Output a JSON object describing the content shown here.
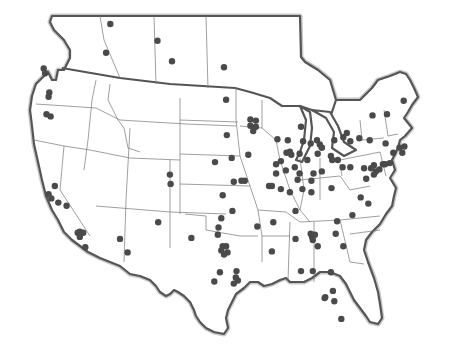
{
  "map": {
    "title": "",
    "region": "United States and southern Canada",
    "projection": "simple equirectangular approximation",
    "colors": {
      "dot": "#4a4a4a",
      "outline": "#555555",
      "border": "#777777",
      "background": "#ffffff"
    },
    "locations": [
      {
        "region": "British Columbia",
        "lon": -123.1,
        "lat": 49.8
      },
      {
        "region": "British Columbia",
        "lon": -122.9,
        "lat": 49.4
      },
      {
        "region": "Alberta",
        "lon": -114.1,
        "lat": 51.1
      },
      {
        "region": "Alberta",
        "lon": -113.5,
        "lat": 53.5
      },
      {
        "region": "Saskatchewan",
        "lon": -106.7,
        "lat": 52.1
      },
      {
        "region": "Saskatchewan",
        "lon": -104.6,
        "lat": 50.4
      },
      {
        "region": "Manitoba",
        "lon": -97.1,
        "lat": 49.9
      },
      {
        "region": "Washington",
        "lon": -122.3,
        "lat": 47.6
      },
      {
        "region": "Washington",
        "lon": -122.4,
        "lat": 47.2
      },
      {
        "region": "Oregon",
        "lon": -122.7,
        "lat": 45.5
      },
      {
        "region": "Oregon",
        "lon": -122.1,
        "lat": 45.3
      },
      {
        "region": "California",
        "lon": -122.4,
        "lat": 37.8
      },
      {
        "region": "California",
        "lon": -122.0,
        "lat": 37.4
      },
      {
        "region": "California",
        "lon": -121.5,
        "lat": 38.6
      },
      {
        "region": "California",
        "lon": -121.0,
        "lat": 37.0
      },
      {
        "region": "California",
        "lon": -119.8,
        "lat": 36.7
      },
      {
        "region": "California",
        "lon": -118.2,
        "lat": 34.1
      },
      {
        "region": "California",
        "lon": -117.9,
        "lat": 34.2
      },
      {
        "region": "California",
        "lon": -117.4,
        "lat": 34.1
      },
      {
        "region": "California",
        "lon": -117.9,
        "lat": 33.7
      },
      {
        "region": "California",
        "lon": -117.1,
        "lat": 32.7
      },
      {
        "region": "Arizona",
        "lon": -112.1,
        "lat": 33.5
      },
      {
        "region": "Arizona",
        "lon": -111.0,
        "lat": 32.2
      },
      {
        "region": "New Mexico",
        "lon": -106.6,
        "lat": 35.1
      },
      {
        "region": "Colorado",
        "lon": -104.9,
        "lat": 39.7
      },
      {
        "region": "Colorado",
        "lon": -104.8,
        "lat": 38.8
      },
      {
        "region": "Texas",
        "lon": -101.8,
        "lat": 33.6
      },
      {
        "region": "Texas",
        "lon": -97.3,
        "lat": 32.8
      },
      {
        "region": "Texas",
        "lon": -96.8,
        "lat": 32.8
      },
      {
        "region": "Texas",
        "lon": -97.5,
        "lat": 32.4
      },
      {
        "region": "Texas",
        "lon": -96.6,
        "lat": 32.2
      },
      {
        "region": "Texas",
        "lon": -97.1,
        "lat": 32.0
      },
      {
        "region": "Texas",
        "lon": -98.0,
        "lat": 33.9
      },
      {
        "region": "Texas",
        "lon": -97.7,
        "lat": 30.3
      },
      {
        "region": "Texas",
        "lon": -95.4,
        "lat": 29.8
      },
      {
        "region": "Texas",
        "lon": -95.1,
        "lat": 29.5
      },
      {
        "region": "Texas",
        "lon": -95.7,
        "lat": 29.2
      },
      {
        "region": "Texas",
        "lon": -95.3,
        "lat": 30.4
      },
      {
        "region": "Texas",
        "lon": -98.5,
        "lat": 29.4
      },
      {
        "region": "Oklahoma",
        "lon": -97.5,
        "lat": 35.5
      },
      {
        "region": "Oklahoma",
        "lon": -95.9,
        "lat": 36.2
      },
      {
        "region": "Oklahoma",
        "lon": -97.9,
        "lat": 34.6
      },
      {
        "region": "Kansas",
        "lon": -97.3,
        "lat": 37.7
      },
      {
        "region": "Kansas",
        "lon": -95.7,
        "lat": 39.0
      },
      {
        "region": "Nebraska",
        "lon": -96.0,
        "lat": 41.3
      },
      {
        "region": "Nebraska",
        "lon": -98.4,
        "lat": 40.9
      },
      {
        "region": "South Dakota",
        "lon": -96.7,
        "lat": 43.5
      },
      {
        "region": "North Dakota",
        "lon": -96.8,
        "lat": 46.9
      },
      {
        "region": "Minnesota",
        "lon": -93.3,
        "lat": 45.0
      },
      {
        "region": "Minnesota",
        "lon": -92.5,
        "lat": 44.9
      },
      {
        "region": "Minnesota",
        "lon": -93.3,
        "lat": 44.4
      },
      {
        "region": "Minnesota",
        "lon": -92.5,
        "lat": 44.3
      },
      {
        "region": "Minnesota",
        "lon": -92.9,
        "lat": 43.9
      },
      {
        "region": "Iowa",
        "lon": -93.6,
        "lat": 41.6
      },
      {
        "region": "Missouri",
        "lon": -94.6,
        "lat": 39.1
      },
      {
        "region": "Missouri",
        "lon": -94.1,
        "lat": 39.1
      },
      {
        "region": "Missouri",
        "lon": -90.2,
        "lat": 38.6
      },
      {
        "region": "Missouri",
        "lon": -90.6,
        "lat": 38.6
      },
      {
        "region": "Arkansas",
        "lon": -92.3,
        "lat": 34.7
      },
      {
        "region": "Mississippi",
        "lon": -90.2,
        "lat": 32.3
      },
      {
        "region": "Tennessee",
        "lon": -90.0,
        "lat": 35.1
      },
      {
        "region": "Tennessee",
        "lon": -86.8,
        "lat": 36.2
      },
      {
        "region": "Alabama",
        "lon": -86.8,
        "lat": 33.5
      },
      {
        "region": "Georgia",
        "lon": -84.4,
        "lat": 33.7
      },
      {
        "region": "Georgia",
        "lon": -84.6,
        "lat": 34.0
      },
      {
        "region": "Georgia",
        "lon": -84.0,
        "lat": 33.9
      },
      {
        "region": "Georgia",
        "lon": -84.3,
        "lat": 33.4
      },
      {
        "region": "Georgia",
        "lon": -83.6,
        "lat": 32.8
      },
      {
        "region": "South Carolina",
        "lon": -81.0,
        "lat": 34.0
      },
      {
        "region": "South Carolina",
        "lon": -79.9,
        "lat": 32.8
      },
      {
        "region": "North Carolina",
        "lon": -80.8,
        "lat": 35.2
      },
      {
        "region": "North Carolina",
        "lon": -78.6,
        "lat": 35.8
      },
      {
        "region": "Florida",
        "lon": -86.0,
        "lat": 30.4
      },
      {
        "region": "Florida",
        "lon": -84.3,
        "lat": 30.4
      },
      {
        "region": "Florida",
        "lon": -81.7,
        "lat": 30.3
      },
      {
        "region": "Florida",
        "lon": -81.4,
        "lat": 28.5
      },
      {
        "region": "Florida",
        "lon": -82.5,
        "lat": 27.9
      },
      {
        "region": "Florida",
        "lon": -82.6,
        "lat": 27.8
      },
      {
        "region": "Florida",
        "lon": -81.2,
        "lat": 27.5
      },
      {
        "region": "Florida",
        "lon": -80.2,
        "lat": 25.8
      },
      {
        "region": "Wisconsin",
        "lon": -89.4,
        "lat": 43.1
      },
      {
        "region": "Wisconsin",
        "lon": -87.9,
        "lat": 43.0
      },
      {
        "region": "Illinois",
        "lon": -87.6,
        "lat": 41.9
      },
      {
        "region": "Illinois",
        "lon": -88.1,
        "lat": 41.8
      },
      {
        "region": "Illinois",
        "lon": -89.6,
        "lat": 40.7
      },
      {
        "region": "Illinois",
        "lon": -88.2,
        "lat": 40.1
      },
      {
        "region": "Illinois",
        "lon": -89.6,
        "lat": 39.8
      },
      {
        "region": "Illinois",
        "lon": -88.9,
        "lat": 41.0
      },
      {
        "region": "Illinois",
        "lon": -88.9,
        "lat": 38.3
      },
      {
        "region": "Indiana",
        "lon": -87.4,
        "lat": 41.6
      },
      {
        "region": "Indiana",
        "lon": -86.2,
        "lat": 41.7
      },
      {
        "region": "Indiana",
        "lon": -85.1,
        "lat": 41.1
      },
      {
        "region": "Indiana",
        "lon": -86.2,
        "lat": 39.8
      },
      {
        "region": "Indiana",
        "lon": -86.5,
        "lat": 39.2
      },
      {
        "region": "Indiana",
        "lon": -87.6,
        "lat": 38.0
      },
      {
        "region": "Indiana",
        "lon": -86.9,
        "lat": 40.4
      },
      {
        "region": "Michigan",
        "lon": -85.7,
        "lat": 42.9
      },
      {
        "region": "Michigan",
        "lon": -84.6,
        "lat": 42.7
      },
      {
        "region": "Michigan",
        "lon": -83.0,
        "lat": 42.3
      },
      {
        "region": "Michigan",
        "lon": -83.3,
        "lat": 42.6
      },
      {
        "region": "Michigan",
        "lon": -83.7,
        "lat": 43.0
      },
      {
        "region": "Michigan",
        "lon": -86.0,
        "lat": 44.3
      },
      {
        "region": "Ohio",
        "lon": -84.2,
        "lat": 39.8
      },
      {
        "region": "Ohio",
        "lon": -84.5,
        "lat": 39.1
      },
      {
        "region": "Ohio",
        "lon": -83.0,
        "lat": 40.0
      },
      {
        "region": "Ohio",
        "lon": -81.7,
        "lat": 41.5
      },
      {
        "region": "Ohio",
        "lon": -81.5,
        "lat": 41.1
      },
      {
        "region": "Ohio",
        "lon": -83.6,
        "lat": 41.7
      },
      {
        "region": "Ohio",
        "lon": -80.7,
        "lat": 41.1
      },
      {
        "region": "Kentucky",
        "lon": -85.8,
        "lat": 38.3
      },
      {
        "region": "Kentucky",
        "lon": -84.5,
        "lat": 38.0
      },
      {
        "region": "West Virginia",
        "lon": -81.6,
        "lat": 38.4
      },
      {
        "region": "Pennsylvania",
        "lon": -80.0,
        "lat": 40.4
      },
      {
        "region": "Pennsylvania",
        "lon": -76.9,
        "lat": 40.3
      },
      {
        "region": "Pennsylvania",
        "lon": -75.9,
        "lat": 40.3
      },
      {
        "region": "Pennsylvania",
        "lon": -75.2,
        "lat": 40.0
      },
      {
        "region": "Pennsylvania",
        "lon": -75.5,
        "lat": 40.6
      },
      {
        "region": "Pennsylvania",
        "lon": -78.9,
        "lat": 40.4
      },
      {
        "region": "New Jersey",
        "lon": -74.2,
        "lat": 40.7
      },
      {
        "region": "New Jersey",
        "lon": -74.7,
        "lat": 40.2
      },
      {
        "region": "Maryland",
        "lon": -76.6,
        "lat": 39.3
      },
      {
        "region": "Delaware",
        "lon": -75.5,
        "lat": 39.7
      },
      {
        "region": "Virginia",
        "lon": -77.4,
        "lat": 37.5
      },
      {
        "region": "Virginia",
        "lon": -76.3,
        "lat": 36.9
      },
      {
        "region": "New York",
        "lon": -78.9,
        "lat": 42.9
      },
      {
        "region": "New York",
        "lon": -77.6,
        "lat": 43.2
      },
      {
        "region": "New York",
        "lon": -76.1,
        "lat": 43.0
      },
      {
        "region": "New York",
        "lon": -73.8,
        "lat": 42.7
      },
      {
        "region": "New York",
        "lon": -73.9,
        "lat": 40.7
      },
      {
        "region": "New York",
        "lon": -73.2,
        "lat": 40.8
      },
      {
        "region": "Connecticut",
        "lon": -72.7,
        "lat": 41.8
      },
      {
        "region": "Massachusetts",
        "lon": -71.1,
        "lat": 42.4
      },
      {
        "region": "Massachusetts",
        "lon": -71.8,
        "lat": 42.3
      },
      {
        "region": "Rhode Island",
        "lon": -71.4,
        "lat": 41.8
      },
      {
        "region": "Ontario",
        "lon": -79.4,
        "lat": 43.7
      },
      {
        "region": "Ontario",
        "lon": -79.9,
        "lat": 43.3
      },
      {
        "region": "Ontario",
        "lon": -81.2,
        "lat": 43.0
      },
      {
        "region": "Ontario",
        "lon": -83.0,
        "lat": 42.3
      },
      {
        "region": "Ontario",
        "lon": -75.7,
        "lat": 45.4
      },
      {
        "region": "Quebec",
        "lon": -73.6,
        "lat": 45.5
      },
      {
        "region": "Quebec",
        "lon": -71.2,
        "lat": 46.8
      }
    ]
  }
}
